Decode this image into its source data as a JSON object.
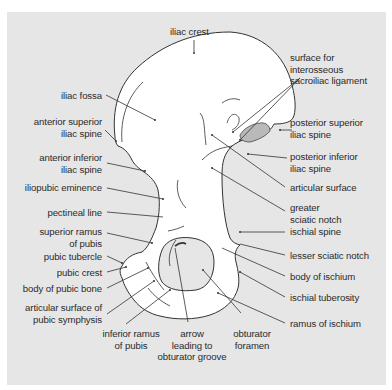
{
  "figure": {
    "colors": {
      "background": "#e6e6e6",
      "bone_fill": "#ffffff",
      "outline": "#333333",
      "articular_surface": "#b5b5b5",
      "leader_lines": "#333333",
      "label_text": "#2b2b2b"
    }
  },
  "labels": {
    "top": [
      {
        "id": "iliac-crest",
        "text": "iliac crest"
      }
    ],
    "left": [
      {
        "id": "iliac-fossa",
        "text": "iliac fossa"
      },
      {
        "id": "anterior-superior-iliac-spine",
        "lines": [
          "anterior superior",
          "iliac spine"
        ]
      },
      {
        "id": "anterior-inferior-iliac-spine",
        "lines": [
          "anterior inferior",
          "iliac spine"
        ]
      },
      {
        "id": "iliopubic-eminence",
        "text": "iliopubic eminence"
      },
      {
        "id": "pectineal-line",
        "text": "pectineal line"
      },
      {
        "id": "superior-ramus-of-pubis",
        "lines": [
          "superior ramus",
          "of pubis"
        ]
      },
      {
        "id": "pubic-tubercle",
        "text": "pubic tubercle"
      },
      {
        "id": "pubic-crest",
        "text": "pubic crest"
      },
      {
        "id": "body-of-pubic-bone",
        "text": "body of pubic bone"
      },
      {
        "id": "articular-surface-of-pubic-symphysis",
        "lines": [
          "articular surface of",
          "pubic symphysis"
        ]
      }
    ],
    "bottom": [
      {
        "id": "inferior-ramus-of-pubis",
        "lines": [
          "inferior ramus",
          "of pubis"
        ]
      },
      {
        "id": "arrow-leading-to-obturator-groove",
        "lines": [
          "arrow",
          "leading to",
          "obturator groove"
        ]
      },
      {
        "id": "obturator-foramen",
        "lines": [
          "obturator",
          "foramen"
        ]
      }
    ],
    "right": [
      {
        "id": "surface-for-interosseous-sacroiliac-ligament",
        "lines": [
          "surface for",
          "interosseous",
          "sacroiliac ligament"
        ]
      },
      {
        "id": "posterior-superior-iliac-spine",
        "lines": [
          "posterior superior",
          "iliac spine"
        ]
      },
      {
        "id": "posterior-inferior-iliac-spine",
        "lines": [
          "posterior inferior",
          "iliac spine"
        ]
      },
      {
        "id": "articular-surface",
        "text": "articular surface"
      },
      {
        "id": "greater-sciatic-notch",
        "lines": [
          "greater",
          "sciatic notch"
        ]
      },
      {
        "id": "ischial-spine",
        "text": "ischial spine"
      },
      {
        "id": "lesser-sciatic-notch",
        "text": "lesser sciatic notch"
      },
      {
        "id": "body-of-ischium",
        "text": "body of ischium"
      },
      {
        "id": "ischial-tuberosity",
        "text": "ischial tuberosity"
      },
      {
        "id": "ramus-of-ischium",
        "text": "ramus of ischium"
      }
    ]
  }
}
